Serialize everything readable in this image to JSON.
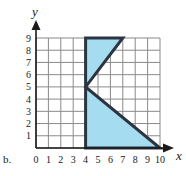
{
  "figure": {
    "item_label": "b.",
    "axis_x_name": "x",
    "axis_y_name": "y",
    "origin_label": "0"
  },
  "colors": {
    "fill": "#a5dcf0",
    "outline": "#2b3440",
    "grid": "#8a8a8a",
    "axis": "#1a1a1a",
    "background": "#ffffff"
  },
  "chart_data": {
    "type": "line",
    "title": "",
    "xlabel": "x",
    "ylabel": "y",
    "xlim": [
      0,
      10
    ],
    "ylim": [
      0,
      9
    ],
    "grid": true,
    "legend": null,
    "x_ticks": [
      0,
      1,
      2,
      3,
      4,
      5,
      6,
      7,
      8,
      9,
      10
    ],
    "y_ticks": [
      1,
      2,
      3,
      4,
      5,
      6,
      7,
      8,
      9
    ],
    "x_tick_labels": [
      "0",
      "1",
      "2",
      "3",
      "4",
      "5",
      "6",
      "7",
      "8",
      "9",
      "10"
    ],
    "y_tick_labels": [
      "1",
      "2",
      "3",
      "4",
      "5",
      "6",
      "7",
      "8",
      "9"
    ],
    "series": [
      {
        "name": "shaded-region",
        "kind": "polygon",
        "closed": true,
        "fill": "#a5dcf0",
        "stroke": "#2b3440",
        "points": [
          [
            4,
            0
          ],
          [
            4,
            9
          ],
          [
            7,
            9
          ],
          [
            4,
            5
          ],
          [
            10,
            0
          ]
        ]
      }
    ],
    "annotations": []
  }
}
